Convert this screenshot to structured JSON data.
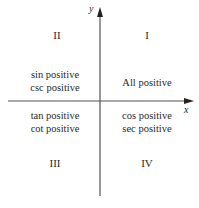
{
  "axes": {
    "x_label": "x",
    "y_label": "y"
  },
  "quadrants": {
    "I": {
      "numeral": "I",
      "lines": [
        "All positive"
      ]
    },
    "II": {
      "numeral": "II",
      "lines": [
        "sin positive",
        "csc positive"
      ]
    },
    "III": {
      "numeral": "III",
      "lines": [
        "tan positive",
        "cot positive"
      ]
    },
    "IV": {
      "numeral": "IV",
      "lines": [
        "cos positive",
        "sec positive"
      ]
    }
  }
}
